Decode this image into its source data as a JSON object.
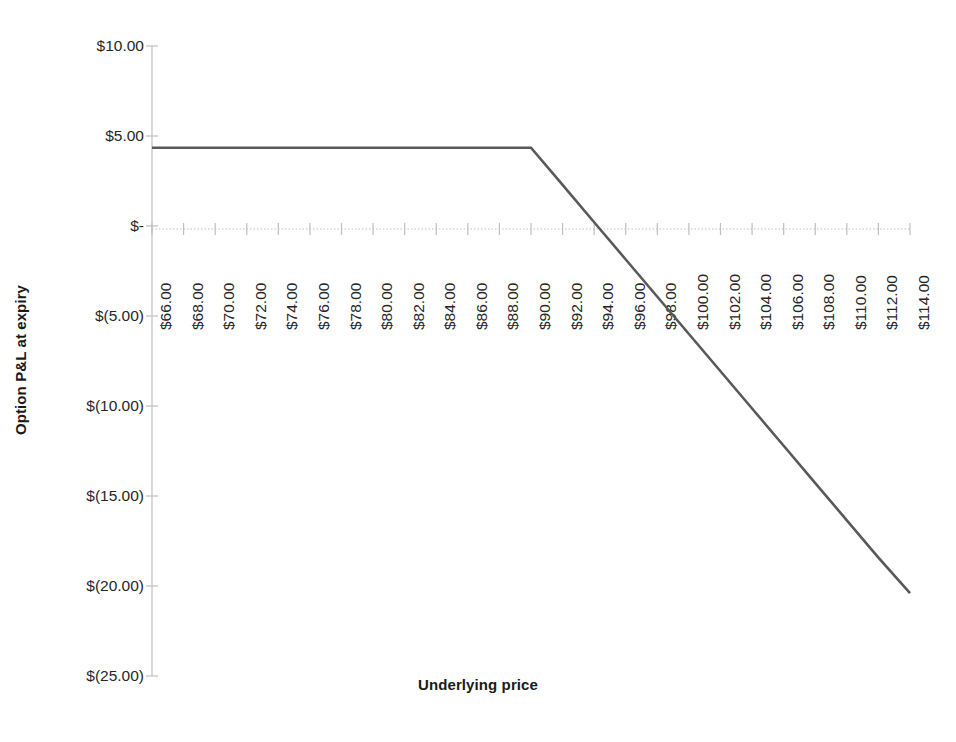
{
  "chart_data": {
    "type": "line",
    "title": "",
    "xlabel": "Underlying price",
    "ylabel": "Option P&L at expiry",
    "xlim": [
      66,
      114
    ],
    "ylim": [
      -25,
      10
    ],
    "grid": "zero-line-only",
    "legend": "none",
    "line_color": "#595959",
    "x_tick_labels": [
      "$66.00",
      "$68.00",
      "$70.00",
      "$72.00",
      "$74.00",
      "$76.00",
      "$78.00",
      "$80.00",
      "$82.00",
      "$84.00",
      "$86.00",
      "$88.00",
      "$90.00",
      "$92.00",
      "$94.00",
      "$96.00",
      "$98.00",
      "$100.00",
      "$102.00",
      "$104.00",
      "$106.00",
      "$108.00",
      "$110.00",
      "$112.00",
      "$114.00"
    ],
    "x_tick_values": [
      66,
      68,
      70,
      72,
      74,
      76,
      78,
      80,
      82,
      84,
      86,
      88,
      90,
      92,
      94,
      96,
      98,
      100,
      102,
      104,
      106,
      108,
      110,
      112,
      114
    ],
    "y_tick_labels": [
      "$10.00",
      "$5.00",
      "$-",
      "$(5.00)",
      "$(10.00)",
      "$(15.00)",
      "$(20.00)",
      "$(25.00)"
    ],
    "y_tick_values": [
      10,
      5,
      0,
      -5,
      -10,
      -15,
      -20,
      -25
    ],
    "series": [
      {
        "name": "Short call P&L at expiry",
        "x": [
          66,
          68,
          70,
          72,
          74,
          76,
          78,
          80,
          82,
          84,
          86,
          88,
          90,
          92,
          94,
          96,
          98,
          100,
          102,
          104,
          106,
          108,
          110,
          112,
          114
        ],
        "values": [
          4.35,
          4.35,
          4.35,
          4.35,
          4.35,
          4.35,
          4.35,
          4.35,
          4.35,
          4.35,
          4.35,
          4.35,
          4.35,
          2.28,
          0.21,
          -1.86,
          -3.93,
          -6.0,
          -8.07,
          -10.14,
          -12.21,
          -14.28,
          -16.35,
          -18.42,
          -20.4
        ]
      }
    ],
    "annotations": {
      "max_profit": 4.35,
      "strike": 90,
      "breakeven": 94.35
    }
  }
}
